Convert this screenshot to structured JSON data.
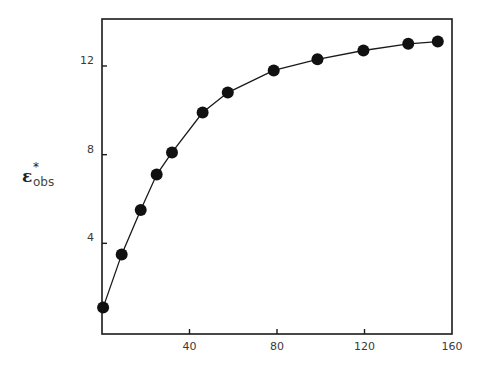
{
  "chart_data": {
    "type": "line",
    "title": "",
    "xlabel": "",
    "ylabel": "ε*obs",
    "ylabel_parts": {
      "symbol": "ε",
      "superscript": "*",
      "subscript": "obs"
    },
    "xlim": [
      0,
      160
    ],
    "ylim": [
      0,
      14.5
    ],
    "x_ticks": [
      40,
      80,
      120,
      160
    ],
    "x_tick_labels": [
      "40",
      "80",
      "120",
      "160"
    ],
    "y_ticks": [
      4,
      8,
      12
    ],
    "y_tick_labels": [
      "4",
      "8",
      "12"
    ],
    "grid": false,
    "legend": null,
    "marker": "filled-circle",
    "line_style": "solid",
    "series": [
      {
        "name": "ε*obs",
        "x": [
          0.5,
          9,
          17.7,
          25,
          32,
          46,
          57.5,
          78.5,
          98.5,
          119.5,
          140,
          153.5
        ],
        "y": [
          1.1,
          3.5,
          5.5,
          7.1,
          8.1,
          9.9,
          10.8,
          11.8,
          12.3,
          12.7,
          13.0,
          13.1
        ]
      }
    ]
  },
  "colors": {
    "line": "#1a1a1a",
    "marker": "#111111",
    "axis": "#1a1a1a",
    "background": "#ffffff"
  }
}
